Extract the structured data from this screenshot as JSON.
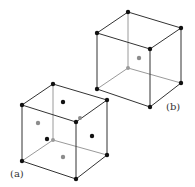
{
  "figure": {
    "labels": {
      "a": "(a)",
      "b": "(b)"
    },
    "colors": {
      "edge": "#333333",
      "hidden_edge": "#9a9a9a",
      "atom_front": "#111111",
      "atom_back": "#8c8c8c"
    },
    "cube_a": {
      "description": "face-centred cubic lattice",
      "corner_atoms": 8,
      "face_atoms": 6
    },
    "cube_b": {
      "description": "body-centred cubic lattice",
      "corner_atoms": 8,
      "center_atoms": 1
    }
  }
}
